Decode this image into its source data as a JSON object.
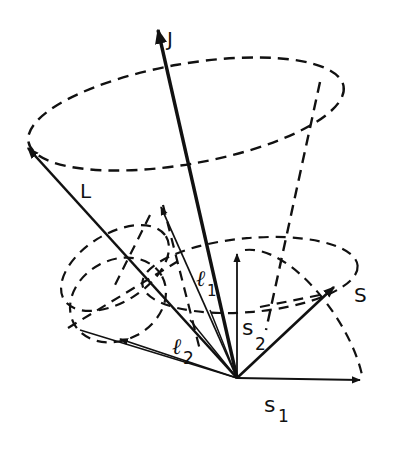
{
  "diagram": {
    "type": "vector-coupling",
    "colors": {
      "ink": "#111111",
      "background": "#ffffff"
    },
    "labels": {
      "J": "J",
      "L": "L",
      "S": "S",
      "l1_main": "ℓ",
      "l1_sub": "1",
      "l2_main": "ℓ",
      "l2_sub": "2",
      "s1_main": "s",
      "s1_sub": "1",
      "s2_main": "s",
      "s2_sub": "2"
    },
    "vectors": [
      {
        "name": "J",
        "from": [
          237,
          378
        ],
        "to": [
          158,
          28
        ],
        "weight": "bold"
      },
      {
        "name": "L",
        "from": [
          237,
          378
        ],
        "to": [
          26,
          146
        ],
        "weight": "medium"
      },
      {
        "name": "S",
        "from": [
          237,
          378
        ],
        "to": [
          336,
          285
        ],
        "weight": "medium"
      },
      {
        "name": "l1",
        "from": [
          237,
          378
        ],
        "to": [
          160,
          205
        ],
        "weight": "thin"
      },
      {
        "name": "l2",
        "from": [
          237,
          378
        ],
        "to": [
          118,
          338
        ],
        "weight": "thin"
      },
      {
        "name": "s1",
        "from": [
          237,
          378
        ],
        "to": [
          362,
          380
        ],
        "weight": "thin"
      },
      {
        "name": "s2",
        "from": [
          237,
          378
        ],
        "to": [
          237,
          252
        ],
        "weight": "thin"
      }
    ]
  }
}
